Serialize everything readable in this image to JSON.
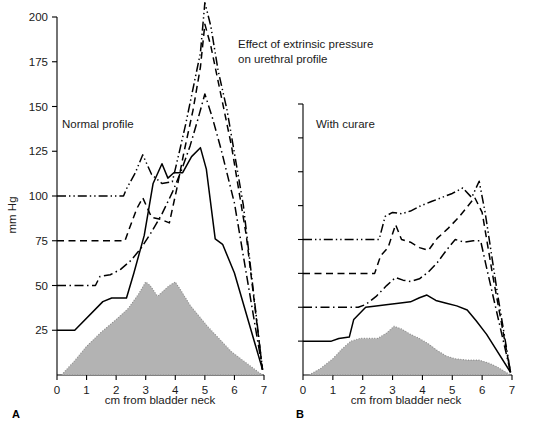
{
  "figure": {
    "title_line1": "Effect of extrinsic pressure",
    "title_line2": "on urethral profile",
    "ylabel": "mm Hg",
    "xlabel_a": "cm from bladder neck",
    "xlabel_b": "cm from bladder neck",
    "panel_a_letter": "A",
    "panel_b_letter": "B",
    "panel_a_caption": "Normal profile",
    "panel_b_caption": "With curare",
    "colors": {
      "line": "#000000",
      "grey_fill": "#b3b3b3",
      "grey_stroke": "#8a8a8a",
      "text": "#1a1a1a"
    }
  },
  "chart_data": [
    {
      "type": "line",
      "panel": "A",
      "title": "Normal profile",
      "xlabel": "cm from bladder neck",
      "ylabel": "mm Hg",
      "xlim": [
        0,
        7
      ],
      "ylim": [
        0,
        200
      ],
      "xticks": [
        0,
        1,
        2,
        3,
        4,
        5,
        6,
        7
      ],
      "xtick_labels": [
        "0",
        "1",
        "2",
        "3",
        "4",
        "5",
        "6",
        "7"
      ],
      "yticks": [
        25,
        50,
        75,
        100,
        125,
        150,
        175,
        200
      ],
      "ytick_labels": [
        "25",
        "50",
        "75",
        "100",
        "125",
        "150",
        "175",
        "200"
      ],
      "grid": false,
      "legend": "none",
      "series": [
        {
          "name": "extrinsic pressure 100 mm Hg",
          "style": "dash-dot-dot",
          "x": [
            0.0,
            2.25,
            2.35,
            2.65,
            2.9,
            3.2,
            3.55,
            3.9,
            4.1,
            4.35,
            4.6,
            4.85,
            5.0,
            5.2,
            5.45,
            5.75,
            6.3,
            6.95
          ],
          "y": [
            100,
            100,
            104,
            113,
            123,
            112,
            107,
            108,
            122,
            140,
            160,
            180,
            208,
            195,
            170,
            148,
            95,
            3
          ]
        },
        {
          "name": "extrinsic pressure 75 mm Hg",
          "style": "dashed",
          "x": [
            0.0,
            2.3,
            2.45,
            2.7,
            2.9,
            3.2,
            3.5,
            3.8,
            4.05,
            4.3,
            4.6,
            4.85,
            5.0,
            5.2,
            5.5,
            5.9,
            6.4,
            6.95
          ],
          "y": [
            75,
            75,
            82,
            93,
            99,
            88,
            87,
            85,
            104,
            125,
            148,
            172,
            196,
            184,
            160,
            128,
            78,
            3
          ]
        },
        {
          "name": "extrinsic pressure 50 mm Hg",
          "style": "dash-dot",
          "x": [
            0.0,
            1.3,
            1.45,
            1.8,
            2.15,
            2.5,
            2.85,
            3.2,
            3.55,
            3.9,
            4.2,
            4.5,
            4.75,
            5.0,
            5.25,
            5.55,
            6.0,
            6.95
          ],
          "y": [
            50,
            50,
            55,
            56,
            59,
            64,
            71,
            80,
            90,
            102,
            114,
            128,
            142,
            157,
            144,
            126,
            96,
            3
          ]
        },
        {
          "name": "extrinsic pressure 25 mm Hg",
          "style": "solid",
          "x": [
            0.0,
            0.6,
            1.55,
            1.85,
            2.35,
            2.6,
            2.95,
            3.25,
            3.55,
            3.75,
            3.95,
            4.25,
            4.55,
            4.85,
            5.05,
            5.35,
            5.6,
            6.0,
            6.95
          ],
          "y": [
            25,
            25,
            41,
            43,
            43,
            57,
            78,
            107,
            118,
            110,
            113,
            113,
            122,
            127,
            115,
            76,
            73,
            57,
            3
          ]
        }
      ],
      "shaded_profile": {
        "name": "urethral pressure profile (shaded)",
        "x": [
          0.15,
          0.6,
          1.0,
          1.5,
          2.0,
          2.4,
          2.75,
          3.0,
          3.15,
          3.4,
          3.6,
          3.8,
          4.0,
          4.2,
          4.5,
          4.8,
          5.1,
          5.5,
          5.9,
          6.3,
          6.7,
          6.95
        ],
        "y": [
          0,
          8,
          16,
          24,
          31,
          37,
          45,
          52,
          50,
          44,
          47,
          50,
          52,
          47,
          39,
          33,
          27,
          20,
          13,
          8,
          3,
          0
        ]
      }
    },
    {
      "type": "line",
      "panel": "B",
      "title": "With curare",
      "xlabel": "cm from bladder neck",
      "ylabel": "mm Hg",
      "xlim": [
        0,
        7
      ],
      "ylim": [
        0,
        200
      ],
      "xticks": [
        0,
        1,
        2,
        3,
        4,
        5,
        6,
        7
      ],
      "xtick_labels": [
        "0",
        "1",
        "2",
        "3",
        "4",
        "5",
        "6",
        "7"
      ],
      "yticks": [
        25,
        50,
        75,
        100,
        125,
        150,
        175,
        200
      ],
      "ytick_labels": [
        "",
        "",
        "",
        "",
        "",
        "",
        "",
        ""
      ],
      "grid": false,
      "legend": "none",
      "series": [
        {
          "name": "extrinsic pressure 100 mm Hg",
          "style": "dash-dot-dot",
          "x": [
            0.0,
            2.55,
            2.75,
            3.0,
            3.3,
            3.6,
            3.95,
            4.3,
            4.65,
            5.0,
            5.35,
            5.65,
            5.9,
            6.1,
            6.5,
            6.95
          ],
          "y": [
            100,
            100,
            117,
            120,
            119,
            121,
            125,
            128,
            131,
            134,
            138,
            131,
            143,
            120,
            62,
            2
          ]
        },
        {
          "name": "extrinsic pressure 75 mm Hg",
          "style": "dashed",
          "x": [
            0.0,
            2.4,
            2.6,
            2.85,
            3.1,
            3.3,
            3.6,
            3.9,
            4.2,
            4.5,
            4.85,
            5.2,
            5.5,
            5.75,
            6.0,
            6.35,
            6.95
          ],
          "y": [
            75,
            75,
            88,
            94,
            111,
            100,
            98,
            94,
            92,
            101,
            108,
            116,
            124,
            131,
            120,
            74,
            2
          ]
        },
        {
          "name": "extrinsic pressure 50 mm Hg",
          "style": "dash-dot",
          "x": [
            0.0,
            1.85,
            2.1,
            2.45,
            2.8,
            3.1,
            3.35,
            3.6,
            3.9,
            4.2,
            4.5,
            4.8,
            5.1,
            5.4,
            5.7,
            5.95,
            6.15,
            6.95
          ],
          "y": [
            50,
            50,
            52,
            58,
            66,
            72,
            70,
            69,
            71,
            76,
            83,
            92,
            100,
            98,
            99,
            99,
            79,
            2
          ]
        },
        {
          "name": "extrinsic pressure 25 mm Hg",
          "style": "solid",
          "x": [
            0.0,
            0.95,
            1.2,
            1.55,
            1.7,
            2.1,
            2.45,
            2.85,
            3.2,
            3.6,
            3.9,
            4.15,
            4.45,
            4.8,
            5.15,
            5.5,
            5.8,
            6.15,
            6.95
          ],
          "y": [
            25,
            25,
            27,
            28,
            41,
            50,
            51,
            52,
            53,
            54,
            57,
            59,
            55,
            53,
            51,
            48,
            40,
            30,
            2
          ]
        }
      ],
      "shaded_profile": {
        "name": "urethral pressure profile (shaded)",
        "x": [
          0.2,
          0.6,
          1.0,
          1.3,
          1.6,
          1.9,
          2.2,
          2.5,
          2.8,
          3.05,
          3.3,
          3.6,
          3.9,
          4.2,
          4.5,
          4.8,
          5.1,
          5.5,
          5.9,
          6.2,
          6.5,
          6.8,
          6.95
        ],
        "y": [
          0,
          5,
          12,
          19,
          25,
          27,
          27,
          27,
          31,
          36,
          34,
          30,
          27,
          23,
          18,
          14,
          12,
          11,
          11,
          9,
          6,
          2,
          0
        ]
      }
    }
  ]
}
